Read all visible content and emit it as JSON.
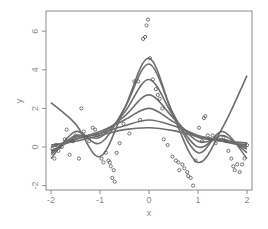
{
  "chart_data": {
    "type": "scatter",
    "title": "",
    "xlabel": "x",
    "ylabel": "y",
    "xlim": [
      -2.06,
      2.1
    ],
    "ylim": [
      -2.25,
      7.0
    ],
    "x_ticks": [
      -2,
      -1,
      0,
      1,
      2
    ],
    "x_tick_labels": [
      "-2",
      "-1",
      "0",
      "1",
      "2"
    ],
    "y_ticks": [
      -2,
      0,
      2,
      4,
      6
    ],
    "y_tick_labels": [
      "-2",
      "0",
      "2",
      "4",
      "6"
    ],
    "grid": false,
    "legend": null,
    "points": {
      "x": [
        -1.97,
        -1.93,
        -1.9,
        -1.85,
        -1.82,
        -1.78,
        -1.72,
        -1.68,
        -1.62,
        -1.55,
        -1.5,
        -1.43,
        -1.38,
        -1.33,
        -1.28,
        -1.22,
        -1.15,
        -1.1,
        -1.05,
        -0.97,
        -0.93,
        -0.88,
        -0.83,
        -0.8,
        -0.78,
        -0.75,
        -0.72,
        -0.7,
        -0.66,
        -0.6,
        -0.52,
        -0.4,
        -0.3,
        -0.22,
        -0.18,
        -0.12,
        -0.08,
        -0.05,
        -0.02,
        0.02,
        0.08,
        0.14,
        0.18,
        0.22,
        0.27,
        0.3,
        0.38,
        0.48,
        0.55,
        0.6,
        0.62,
        0.68,
        0.72,
        0.78,
        0.8,
        0.85,
        0.9,
        0.95,
        1.02,
        1.08,
        1.12,
        1.15,
        1.2,
        1.25,
        1.3,
        1.36,
        1.42,
        1.52,
        1.58,
        1.62,
        1.68,
        1.72,
        1.75,
        1.8,
        1.85,
        1.9,
        1.95,
        2.0
      ],
      "y": [
        -0.1,
        -0.6,
        0.1,
        -0.2,
        0.0,
        0.0,
        0.4,
        0.9,
        -0.4,
        0.3,
        0.6,
        -0.6,
        2.0,
        0.8,
        0.5,
        0.3,
        1.0,
        0.9,
        0.6,
        -0.6,
        -0.8,
        -0.3,
        -0.7,
        -0.8,
        -1.0,
        -1.6,
        -1.2,
        -1.8,
        -0.3,
        0.2,
        1.2,
        0.7,
        3.4,
        3.4,
        1.4,
        5.6,
        5.7,
        6.3,
        6.6,
        4.6,
        3.5,
        3.0,
        2.7,
        2.5,
        2.0,
        0.4,
        0.1,
        -0.5,
        -0.7,
        -0.8,
        -1.2,
        -0.9,
        -1.1,
        -1.3,
        -1.5,
        -1.6,
        -2.0,
        -0.7,
        1.0,
        0.3,
        1.5,
        1.6,
        0.6,
        0.4,
        0.6,
        0.2,
        0.4,
        0.5,
        0.3,
        -0.2,
        -0.6,
        -1.0,
        -1.2,
        -0.9,
        -1.3,
        -0.9,
        -0.6,
        0.1
      ]
    },
    "series": [
      {
        "name": "fit-1",
        "x": [
          -2,
          -1.5,
          -1,
          -0.5,
          0,
          0.5,
          1,
          1.5,
          2
        ],
        "y": [
          0.1,
          0.3,
          0.6,
          0.9,
          1.0,
          0.85,
          0.55,
          0.35,
          0.2
        ]
      },
      {
        "name": "fit-2",
        "x": [
          -2,
          -1.5,
          -1,
          -0.5,
          0,
          0.5,
          1,
          1.5,
          2
        ],
        "y": [
          0.0,
          0.4,
          0.7,
          1.1,
          1.4,
          1.1,
          0.6,
          0.3,
          0.1
        ]
      },
      {
        "name": "fit-3",
        "x": [
          -2,
          -1.5,
          -1,
          -0.5,
          0,
          0.5,
          1,
          1.5,
          2
        ],
        "y": [
          -0.2,
          0.4,
          0.8,
          1.4,
          2.0,
          1.3,
          0.5,
          0.3,
          0.0
        ]
      },
      {
        "name": "fit-4",
        "x": [
          -2,
          -1.5,
          -1,
          -0.5,
          0,
          0.5,
          1,
          1.5,
          2
        ],
        "y": [
          -0.3,
          0.5,
          0.7,
          1.6,
          2.7,
          1.5,
          0.3,
          0.4,
          -0.1
        ]
      },
      {
        "name": "fit-5",
        "x": [
          -2,
          -1.5,
          -1,
          -0.5,
          0,
          0.5,
          1,
          1.5,
          2
        ],
        "y": [
          -0.4,
          0.6,
          0.5,
          1.8,
          3.5,
          1.6,
          0.0,
          0.6,
          -0.3
        ]
      },
      {
        "name": "fit-6",
        "x": [
          -2,
          -1.5,
          -1,
          -0.5,
          0,
          0.5,
          1,
          1.5,
          2
        ],
        "y": [
          -0.6,
          0.8,
          0.2,
          2.0,
          4.3,
          1.7,
          -0.3,
          0.8,
          -0.6
        ]
      },
      {
        "name": "fit-7",
        "x": [
          -2,
          -1.5,
          -1,
          -0.5,
          0,
          0.5,
          1,
          1.5,
          2
        ],
        "y": [
          2.3,
          1.2,
          -0.5,
          2.0,
          4.6,
          1.6,
          -0.8,
          1.0,
          3.7
        ]
      }
    ]
  }
}
